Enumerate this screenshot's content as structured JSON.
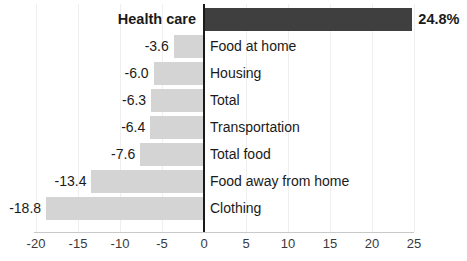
{
  "chart_data": {
    "type": "bar",
    "orientation": "horizontal",
    "title": "",
    "subtitle": "",
    "xlabel": "",
    "ylabel": "",
    "xlim": [
      -20,
      25
    ],
    "grid": true,
    "legend": "none",
    "xticks": [
      "-20",
      "-15",
      "-10",
      "-5",
      "0",
      "5",
      "10",
      "15",
      "20",
      "25"
    ],
    "xtick_values": [
      -20,
      -15,
      -10,
      -5,
      0,
      5,
      10,
      15,
      20,
      25
    ],
    "categories": [
      "Health care",
      "Food at home",
      "Housing",
      "Total",
      "Transportation",
      "Total food",
      "Food away from home",
      "Clothing"
    ],
    "values": [
      24.8,
      -3.6,
      -6.0,
      -6.3,
      -6.4,
      -7.6,
      -13.4,
      -18.8
    ],
    "data_labels": [
      "24.8%",
      "-3.6",
      "-6.0",
      "-6.3",
      "-6.4",
      "-7.6",
      "-13.4",
      "-18.8"
    ],
    "colors": {
      "positive_bar": "#3f3f3f",
      "negative_bar": "#d4d4d4",
      "axis_line": "#1a1a1a",
      "gridline": "#efefef",
      "text": "#1a1a1a",
      "tick_text": "#3a3a3a",
      "background": "#ffffff"
    },
    "bars": [
      {
        "label": "Health care",
        "value": 24.8,
        "data_label": "24.8%",
        "highlight": true
      },
      {
        "label": "Food at home",
        "value": -3.6,
        "data_label": "-3.6",
        "highlight": false
      },
      {
        "label": "Housing",
        "value": -6.0,
        "data_label": "-6.0",
        "highlight": false
      },
      {
        "label": "Total",
        "value": -6.3,
        "data_label": "-6.3",
        "highlight": false
      },
      {
        "label": "Transportation",
        "value": -6.4,
        "data_label": "-6.4",
        "highlight": false
      },
      {
        "label": "Total food",
        "value": -7.6,
        "data_label": "-7.6",
        "highlight": false
      },
      {
        "label": "Food away from home",
        "value": -13.4,
        "data_label": "-13.4",
        "highlight": false
      },
      {
        "label": "Clothing",
        "value": -18.8,
        "data_label": "-18.8",
        "highlight": false
      }
    ]
  }
}
